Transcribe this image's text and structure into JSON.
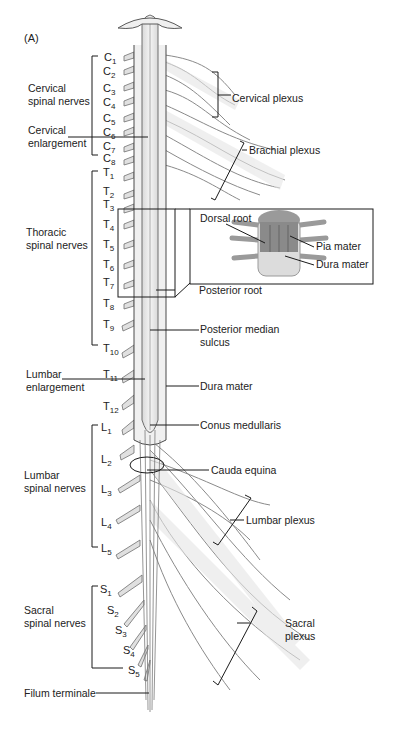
{
  "figure": {
    "panel_label": "(A)"
  },
  "left_labels": {
    "cervical_group": [
      "Cervical",
      "spinal nerves"
    ],
    "cervical_enlargement": [
      "Cervical",
      "enlargement"
    ],
    "thoracic_group": [
      "Thoracic",
      "spinal nerves"
    ],
    "lumbar_enlargement": [
      "Lumbar",
      "enlargement"
    ],
    "lumbar_group": [
      "Lumbar",
      "spinal nerves"
    ],
    "sacral_group": [
      "Sacral",
      "spinal nerves"
    ],
    "filum_terminale": "Filum terminale"
  },
  "segments": {
    "cervical": [
      {
        "letter": "C",
        "num": "1"
      },
      {
        "letter": "C",
        "num": "2"
      },
      {
        "letter": "C",
        "num": "3"
      },
      {
        "letter": "C",
        "num": "4"
      },
      {
        "letter": "C",
        "num": "5"
      },
      {
        "letter": "C",
        "num": "6"
      },
      {
        "letter": "C",
        "num": "7"
      },
      {
        "letter": "C",
        "num": "8"
      }
    ],
    "thoracic": [
      {
        "letter": "T",
        "num": "1"
      },
      {
        "letter": "T",
        "num": "2"
      },
      {
        "letter": "T",
        "num": "3"
      },
      {
        "letter": "T",
        "num": "4"
      },
      {
        "letter": "T",
        "num": "5"
      },
      {
        "letter": "T",
        "num": "6"
      },
      {
        "letter": "T",
        "num": "7"
      },
      {
        "letter": "T",
        "num": "8"
      },
      {
        "letter": "T",
        "num": "9"
      },
      {
        "letter": "T",
        "num": "10"
      },
      {
        "letter": "T",
        "num": "11"
      },
      {
        "letter": "T",
        "num": "12"
      }
    ],
    "lumbar": [
      {
        "letter": "L",
        "num": "1"
      },
      {
        "letter": "L",
        "num": "2"
      },
      {
        "letter": "L",
        "num": "3"
      },
      {
        "letter": "L",
        "num": "4"
      },
      {
        "letter": "L",
        "num": "5"
      }
    ],
    "sacral": [
      {
        "letter": "S",
        "num": "1"
      },
      {
        "letter": "S",
        "num": "2"
      },
      {
        "letter": "S",
        "num": "3"
      },
      {
        "letter": "S",
        "num": "4"
      },
      {
        "letter": "S",
        "num": "5"
      }
    ]
  },
  "right_labels": {
    "cervical_plexus": "Cervical plexus",
    "brachial_plexus": "Brachial plexus",
    "posterior_root": "Posterior root",
    "posterior_median_sulcus": [
      "Posterior median",
      "sulcus"
    ],
    "dura_mater": "Dura mater",
    "conus_medullaris": "Conus medullaris",
    "cauda_equina": "Cauda equina",
    "lumbar_plexus": "Lumbar plexus",
    "sacral_plexus": [
      "Sacral",
      "plexus"
    ]
  },
  "inset": {
    "dorsal_root": "Dorsal root",
    "pia_mater": "Pia mater",
    "dura_mater": "Dura mater"
  },
  "colors": {
    "nerve_fill": "#e6e6e6",
    "nerve_stroke": "#6e6e6e",
    "line": "#1a1a1a",
    "inset_pia": "#8a8a8a",
    "inset_dura": "#d9d9d9"
  }
}
